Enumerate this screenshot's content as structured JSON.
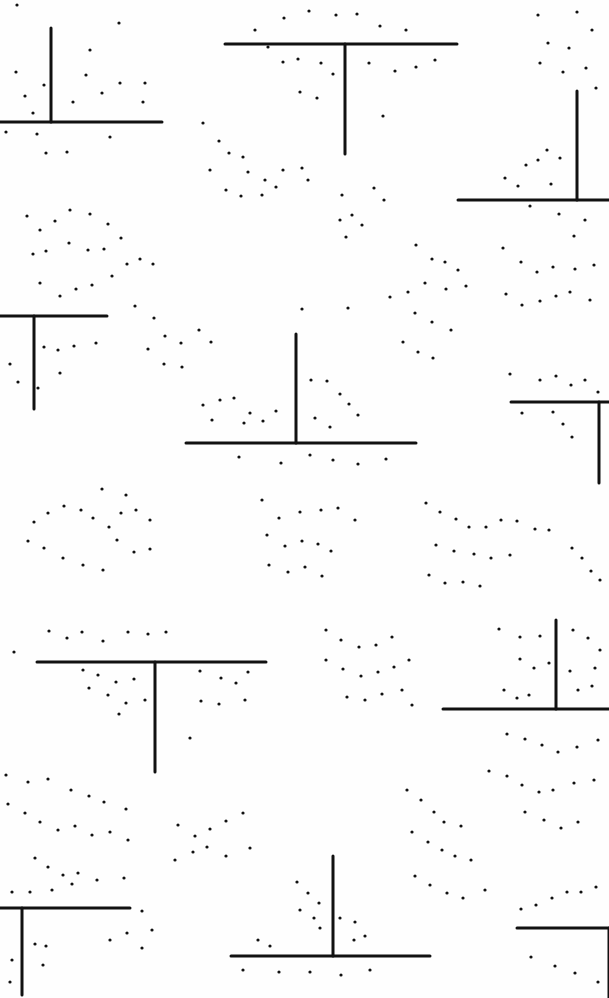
{
  "artwork": {
    "width": 609,
    "height": 998,
    "background": "#fefefe",
    "ink": "#111111",
    "stroke_width": 3,
    "t_shapes": [
      {
        "h": [
          0,
          122,
          162
        ],
        "v": [
          51,
          28,
          122
        ]
      },
      {
        "h": [
          225,
          44,
          457
        ],
        "v": [
          345,
          44,
          154
        ]
      },
      {
        "h": [
          458,
          200,
          609
        ],
        "v": [
          577,
          91,
          200
        ]
      },
      {
        "h": [
          0,
          316,
          107
        ],
        "v": [
          34,
          316,
          409
        ]
      },
      {
        "h": [
          186,
          443,
          416
        ],
        "v": [
          296,
          334,
          443
        ]
      },
      {
        "h": [
          511,
          402,
          609
        ],
        "v": [
          599,
          402,
          483
        ]
      },
      {
        "h": [
          37,
          662,
          266
        ],
        "v": [
          155,
          662,
          772
        ]
      },
      {
        "h": [
          443,
          709,
          609
        ],
        "v": [
          556,
          620,
          709
        ]
      },
      {
        "h": [
          0,
          908,
          130
        ],
        "v": [
          22,
          908,
          995
        ]
      },
      {
        "h": [
          231,
          956,
          430
        ],
        "v": [
          333,
          856,
          956
        ]
      },
      {
        "h": [
          517,
          928,
          609
        ],
        "v": [
          609,
          928,
          998
        ]
      }
    ],
    "dots": [
      [
        17,
        5
      ],
      [
        119,
        23
      ],
      [
        16,
        72
      ],
      [
        90,
        50
      ],
      [
        86,
        75
      ],
      [
        44,
        85
      ],
      [
        120,
        83
      ],
      [
        145,
        83
      ],
      [
        143,
        102
      ],
      [
        102,
        93
      ],
      [
        73,
        102
      ],
      [
        33,
        113
      ],
      [
        25,
        96
      ],
      [
        6,
        132
      ],
      [
        37,
        134
      ],
      [
        46,
        153
      ],
      [
        67,
        152
      ],
      [
        110,
        137
      ],
      [
        255,
        30
      ],
      [
        284,
        18
      ],
      [
        309,
        11
      ],
      [
        336,
        15
      ],
      [
        357,
        14
      ],
      [
        380,
        26
      ],
      [
        406,
        30
      ],
      [
        268,
        47
      ],
      [
        283,
        62
      ],
      [
        298,
        59
      ],
      [
        321,
        63
      ],
      [
        333,
        74
      ],
      [
        369,
        63
      ],
      [
        395,
        71
      ],
      [
        416,
        67
      ],
      [
        435,
        60
      ],
      [
        300,
        92
      ],
      [
        317,
        98
      ],
      [
        383,
        116
      ],
      [
        538,
        15
      ],
      [
        577,
        12
      ],
      [
        592,
        30
      ],
      [
        548,
        43
      ],
      [
        569,
        48
      ],
      [
        540,
        63
      ],
      [
        563,
        72
      ],
      [
        586,
        68
      ],
      [
        596,
        88
      ],
      [
        505,
        178
      ],
      [
        518,
        186
      ],
      [
        538,
        160
      ],
      [
        547,
        150
      ],
      [
        560,
        158
      ],
      [
        526,
        165
      ],
      [
        551,
        184
      ],
      [
        530,
        206
      ],
      [
        559,
        214
      ],
      [
        585,
        220
      ],
      [
        574,
        236
      ],
      [
        203,
        123
      ],
      [
        219,
        141
      ],
      [
        229,
        153
      ],
      [
        243,
        157
      ],
      [
        248,
        172
      ],
      [
        265,
        180
      ],
      [
        210,
        170
      ],
      [
        226,
        190
      ],
      [
        241,
        196
      ],
      [
        262,
        195
      ],
      [
        276,
        187
      ],
      [
        283,
        170
      ],
      [
        302,
        168
      ],
      [
        308,
        180
      ],
      [
        342,
        195
      ],
      [
        352,
        215
      ],
      [
        362,
        225
      ],
      [
        340,
        220
      ],
      [
        374,
        188
      ],
      [
        384,
        200
      ],
      [
        346,
        237
      ],
      [
        27,
        216
      ],
      [
        40,
        230
      ],
      [
        55,
        221
      ],
      [
        70,
        210
      ],
      [
        90,
        214
      ],
      [
        108,
        224
      ],
      [
        121,
        238
      ],
      [
        104,
        249
      ],
      [
        88,
        250
      ],
      [
        69,
        243
      ],
      [
        46,
        251
      ],
      [
        33,
        254
      ],
      [
        40,
        283
      ],
      [
        60,
        296
      ],
      [
        76,
        289
      ],
      [
        92,
        285
      ],
      [
        112,
        276
      ],
      [
        127,
        264
      ],
      [
        140,
        259
      ],
      [
        153,
        264
      ],
      [
        416,
        245
      ],
      [
        432,
        259
      ],
      [
        445,
        262
      ],
      [
        458,
        270
      ],
      [
        466,
        286
      ],
      [
        446,
        289
      ],
      [
        425,
        283
      ],
      [
        408,
        292
      ],
      [
        390,
        297
      ],
      [
        415,
        313
      ],
      [
        432,
        322
      ],
      [
        451,
        330
      ],
      [
        403,
        342
      ],
      [
        418,
        352
      ],
      [
        433,
        358
      ],
      [
        503,
        248
      ],
      [
        521,
        262
      ],
      [
        537,
        272
      ],
      [
        553,
        267
      ],
      [
        575,
        269
      ],
      [
        594,
        265
      ],
      [
        506,
        294
      ],
      [
        522,
        305
      ],
      [
        540,
        301
      ],
      [
        556,
        296
      ],
      [
        570,
        292
      ],
      [
        590,
        300
      ],
      [
        10,
        364
      ],
      [
        18,
        382
      ],
      [
        44,
        347
      ],
      [
        58,
        350
      ],
      [
        74,
        346
      ],
      [
        96,
        343
      ],
      [
        38,
        388
      ],
      [
        60,
        373
      ],
      [
        135,
        306
      ],
      [
        154,
        318
      ],
      [
        165,
        336
      ],
      [
        181,
        343
      ],
      [
        148,
        349
      ],
      [
        164,
        364
      ],
      [
        182,
        367
      ],
      [
        199,
        330
      ],
      [
        211,
        342
      ],
      [
        302,
        309
      ],
      [
        348,
        308
      ],
      [
        311,
        380
      ],
      [
        327,
        381
      ],
      [
        340,
        394
      ],
      [
        349,
        404
      ],
      [
        358,
        415
      ],
      [
        203,
        405
      ],
      [
        220,
        400
      ],
      [
        234,
        398
      ],
      [
        250,
        413
      ],
      [
        263,
        421
      ],
      [
        276,
        411
      ],
      [
        212,
        420
      ],
      [
        244,
        423
      ],
      [
        315,
        418
      ],
      [
        330,
        427
      ],
      [
        239,
        457
      ],
      [
        281,
        463
      ],
      [
        310,
        455
      ],
      [
        333,
        460
      ],
      [
        358,
        464
      ],
      [
        386,
        459
      ],
      [
        510,
        374
      ],
      [
        540,
        380
      ],
      [
        556,
        376
      ],
      [
        571,
        385
      ],
      [
        585,
        380
      ],
      [
        598,
        392
      ],
      [
        522,
        413
      ],
      [
        553,
        412
      ],
      [
        563,
        424
      ],
      [
        572,
        437
      ],
      [
        102,
        489
      ],
      [
        126,
        495
      ],
      [
        136,
        510
      ],
      [
        150,
        520
      ],
      [
        121,
        513
      ],
      [
        109,
        527
      ],
      [
        93,
        518
      ],
      [
        81,
        510
      ],
      [
        64,
        506
      ],
      [
        48,
        513
      ],
      [
        34,
        522
      ],
      [
        117,
        540
      ],
      [
        134,
        552
      ],
      [
        150,
        549
      ],
      [
        28,
        541
      ],
      [
        44,
        548
      ],
      [
        63,
        558
      ],
      [
        83,
        565
      ],
      [
        103,
        570
      ],
      [
        262,
        500
      ],
      [
        279,
        518
      ],
      [
        300,
        512
      ],
      [
        321,
        510
      ],
      [
        338,
        508
      ],
      [
        355,
        520
      ],
      [
        267,
        535
      ],
      [
        285,
        546
      ],
      [
        302,
        541
      ],
      [
        318,
        544
      ],
      [
        331,
        551
      ],
      [
        269,
        565
      ],
      [
        288,
        572
      ],
      [
        305,
        567
      ],
      [
        322,
        576
      ],
      [
        426,
        503
      ],
      [
        440,
        512
      ],
      [
        456,
        519
      ],
      [
        469,
        527
      ],
      [
        486,
        527
      ],
      [
        501,
        520
      ],
      [
        517,
        521
      ],
      [
        535,
        529
      ],
      [
        549,
        530
      ],
      [
        436,
        545
      ],
      [
        454,
        551
      ],
      [
        474,
        554
      ],
      [
        491,
        558
      ],
      [
        510,
        555
      ],
      [
        429,
        575
      ],
      [
        445,
        583
      ],
      [
        463,
        582
      ],
      [
        480,
        586
      ],
      [
        572,
        548
      ],
      [
        582,
        558
      ],
      [
        591,
        571
      ],
      [
        600,
        580
      ],
      [
        14,
        652
      ],
      [
        49,
        631
      ],
      [
        67,
        638
      ],
      [
        82,
        632
      ],
      [
        103,
        641
      ],
      [
        128,
        632
      ],
      [
        148,
        634
      ],
      [
        166,
        632
      ],
      [
        83,
        670
      ],
      [
        98,
        675
      ],
      [
        116,
        682
      ],
      [
        134,
        679
      ],
      [
        89,
        688
      ],
      [
        108,
        695
      ],
      [
        126,
        703
      ],
      [
        145,
        700
      ],
      [
        200,
        671
      ],
      [
        221,
        678
      ],
      [
        236,
        683
      ],
      [
        248,
        672
      ],
      [
        201,
        701
      ],
      [
        219,
        704
      ],
      [
        245,
        700
      ],
      [
        119,
        714
      ],
      [
        190,
        738
      ],
      [
        326,
        630
      ],
      [
        341,
        640
      ],
      [
        359,
        647
      ],
      [
        376,
        645
      ],
      [
        392,
        637
      ],
      [
        326,
        660
      ],
      [
        343,
        669
      ],
      [
        361,
        676
      ],
      [
        378,
        672
      ],
      [
        394,
        667
      ],
      [
        409,
        660
      ],
      [
        347,
        697
      ],
      [
        365,
        700
      ],
      [
        382,
        694
      ],
      [
        402,
        690
      ],
      [
        412,
        705
      ],
      [
        499,
        629
      ],
      [
        520,
        637
      ],
      [
        540,
        636
      ],
      [
        573,
        630
      ],
      [
        588,
        638
      ],
      [
        600,
        650
      ],
      [
        520,
        659
      ],
      [
        534,
        668
      ],
      [
        549,
        663
      ],
      [
        570,
        671
      ],
      [
        595,
        668
      ],
      [
        504,
        690
      ],
      [
        517,
        698
      ],
      [
        529,
        695
      ],
      [
        578,
        690
      ],
      [
        592,
        686
      ],
      [
        507,
        734
      ],
      [
        525,
        739
      ],
      [
        542,
        745
      ],
      [
        558,
        752
      ],
      [
        577,
        747
      ],
      [
        598,
        740
      ],
      [
        489,
        771
      ],
      [
        507,
        776
      ],
      [
        522,
        785
      ],
      [
        539,
        792
      ],
      [
        553,
        790
      ],
      [
        574,
        783
      ],
      [
        594,
        780
      ],
      [
        525,
        812
      ],
      [
        544,
        820
      ],
      [
        561,
        828
      ],
      [
        578,
        822
      ],
      [
        6,
        775
      ],
      [
        28,
        782
      ],
      [
        48,
        779
      ],
      [
        71,
        790
      ],
      [
        89,
        796
      ],
      [
        104,
        802
      ],
      [
        126,
        809
      ],
      [
        8,
        804
      ],
      [
        25,
        813
      ],
      [
        40,
        822
      ],
      [
        58,
        830
      ],
      [
        75,
        826
      ],
      [
        92,
        835
      ],
      [
        110,
        832
      ],
      [
        128,
        840
      ],
      [
        35,
        858
      ],
      [
        48,
        867
      ],
      [
        63,
        875
      ],
      [
        78,
        873
      ],
      [
        97,
        880
      ],
      [
        124,
        878
      ],
      [
        12,
        892
      ],
      [
        30,
        892
      ],
      [
        52,
        890
      ],
      [
        72,
        884
      ],
      [
        178,
        825
      ],
      [
        195,
        836
      ],
      [
        210,
        829
      ],
      [
        226,
        821
      ],
      [
        243,
        813
      ],
      [
        175,
        860
      ],
      [
        193,
        852
      ],
      [
        207,
        847
      ],
      [
        226,
        856
      ],
      [
        250,
        848
      ],
      [
        407,
        790
      ],
      [
        421,
        800
      ],
      [
        434,
        812
      ],
      [
        444,
        822
      ],
      [
        461,
        826
      ],
      [
        412,
        832
      ],
      [
        428,
        842
      ],
      [
        442,
        850
      ],
      [
        455,
        856
      ],
      [
        471,
        860
      ],
      [
        415,
        876
      ],
      [
        430,
        885
      ],
      [
        447,
        893
      ],
      [
        463,
        898
      ],
      [
        485,
        890
      ],
      [
        297,
        882
      ],
      [
        308,
        893
      ],
      [
        319,
        903
      ],
      [
        300,
        910
      ],
      [
        314,
        918
      ],
      [
        320,
        928
      ],
      [
        340,
        918
      ],
      [
        355,
        922
      ],
      [
        365,
        936
      ],
      [
        258,
        940
      ],
      [
        270,
        946
      ],
      [
        354,
        940
      ],
      [
        142,
        911
      ],
      [
        152,
        930
      ],
      [
        127,
        933
      ],
      [
        142,
        948
      ],
      [
        110,
        940
      ],
      [
        35,
        944
      ],
      [
        46,
        946
      ],
      [
        43,
        965
      ],
      [
        12,
        960
      ],
      [
        10,
        982
      ],
      [
        521,
        909
      ],
      [
        536,
        905
      ],
      [
        552,
        898
      ],
      [
        567,
        892
      ],
      [
        581,
        892
      ],
      [
        596,
        887
      ],
      [
        531,
        957
      ],
      [
        555,
        966
      ],
      [
        575,
        973
      ],
      [
        598,
        982
      ],
      [
        243,
        970
      ],
      [
        279,
        972
      ],
      [
        310,
        972
      ],
      [
        341,
        975
      ],
      [
        370,
        970
      ]
    ]
  }
}
